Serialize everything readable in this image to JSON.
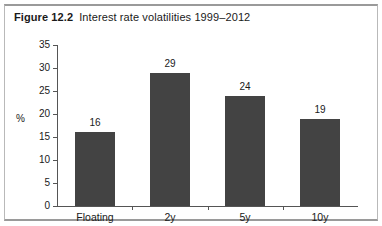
{
  "figure": {
    "number": "Figure 12.2",
    "title": "Interest rate volatilities 1999–2012"
  },
  "colors": {
    "bar_fill": "#434343",
    "axis": "#555555",
    "frame": "#9a9a9a",
    "background": "#ffffff",
    "text": "#1a1a1a"
  },
  "chart_data": {
    "type": "bar",
    "title": "Interest rate volatilities 1999–2012",
    "categories": [
      "Floating",
      "2y",
      "5y",
      "10y"
    ],
    "values": [
      16,
      29,
      24,
      19
    ],
    "data_labels": [
      "16",
      "29",
      "24",
      "19"
    ],
    "xlabel": "",
    "ylabel": "%",
    "ylim": [
      0,
      35
    ],
    "yticks": [
      0,
      5,
      10,
      15,
      20,
      25,
      30,
      35
    ],
    "ytick_labels": [
      "0",
      "5",
      "10",
      "15",
      "20",
      "25",
      "30",
      "35"
    ],
    "grid": false,
    "legend": false
  }
}
